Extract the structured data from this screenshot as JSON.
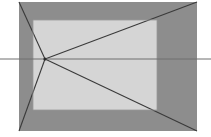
{
  "figure": {
    "name": "one-point-perspective-box",
    "width": 211,
    "height": 137,
    "background_color": "#ffffff"
  },
  "colors": {
    "background": "#ffffff",
    "outer_face": "#8d8d8d",
    "inner_face": "#d5d5d5",
    "line": "#3a3a3a",
    "horizon_line": "#6e6e6e",
    "edge_line": "#555555"
  },
  "geometry": {
    "outer_rect": {
      "x": 19,
      "y": 2,
      "width": 178,
      "height": 129
    },
    "inner_rect": {
      "x": 33,
      "y": 20,
      "width": 124,
      "height": 90
    },
    "vanishing_point": {
      "x": 45,
      "y": 59
    },
    "horizon_line": {
      "x1": 0,
      "y1": 59,
      "x2": 211,
      "y2": 59
    }
  },
  "shapes": {
    "outer_face_label": "outer-rectangle-face",
    "inner_face_label": "inner-rectangle-face",
    "horizon_label": "horizon-line",
    "vanishing_point_label": "vanishing-point"
  },
  "orthogonals": [
    {
      "name": "orthogonal-top-left",
      "x1": 19,
      "y1": 2,
      "x2": 45,
      "y2": 59
    },
    {
      "name": "orthogonal-top-right",
      "x1": 197,
      "y1": 2,
      "x2": 45,
      "y2": 59
    },
    {
      "name": "orthogonal-bottom-left",
      "x1": 19,
      "y1": 131,
      "x2": 45,
      "y2": 59
    },
    {
      "name": "orthogonal-bottom-right",
      "x1": 197,
      "y1": 131,
      "x2": 45,
      "y2": 59
    }
  ],
  "inner_edges": [
    {
      "name": "inner-edge-top",
      "x1": 33,
      "y1": 20,
      "x2": 157,
      "y2": 20
    },
    {
      "name": "inner-edge-right",
      "x1": 157,
      "y1": 20,
      "x2": 157,
      "y2": 110
    },
    {
      "name": "inner-edge-bottom",
      "x1": 157,
      "y1": 110,
      "x2": 33,
      "y2": 110
    },
    {
      "name": "inner-edge-left",
      "x1": 33,
      "y1": 110,
      "x2": 33,
      "y2": 20
    }
  ]
}
